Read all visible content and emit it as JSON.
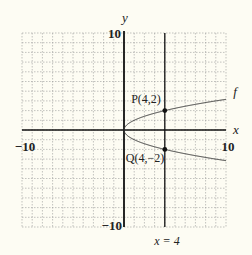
{
  "chart_data": {
    "type": "line",
    "title": "",
    "xlabel": "x",
    "ylabel": "y",
    "xlim": [
      -10,
      10
    ],
    "ylim": [
      -10,
      10
    ],
    "grid": true,
    "grid_step": 1,
    "tick_labels": {
      "x_min": "−10",
      "x_max": "10",
      "y_max": "10",
      "y_min": "−10"
    },
    "series": [
      {
        "name": "f",
        "label": "f",
        "equation": "x = y^2 (y = ±√x)",
        "x": [
          0,
          0.25,
          1,
          2.25,
          4,
          6.25,
          9,
          10
        ],
        "y_upper": [
          0,
          0.5,
          1,
          1.5,
          2,
          2.5,
          3,
          3.162
        ],
        "y_lower": [
          0,
          -0.5,
          -1,
          -1.5,
          -2,
          -2.5,
          -3,
          -3.162
        ]
      }
    ],
    "vertical_lines": [
      {
        "x": 4,
        "label": "x = 4"
      }
    ],
    "points": [
      {
        "name": "P",
        "x": 4,
        "y": 2,
        "label": "P(4,2)"
      },
      {
        "name": "Q",
        "x": 4,
        "y": -2,
        "label": "Q(4,−2)"
      }
    ],
    "colors": {
      "background": "#fdfcf3",
      "grid": "#9a9a9a",
      "axes": "#111111",
      "curve": "#333333"
    }
  }
}
